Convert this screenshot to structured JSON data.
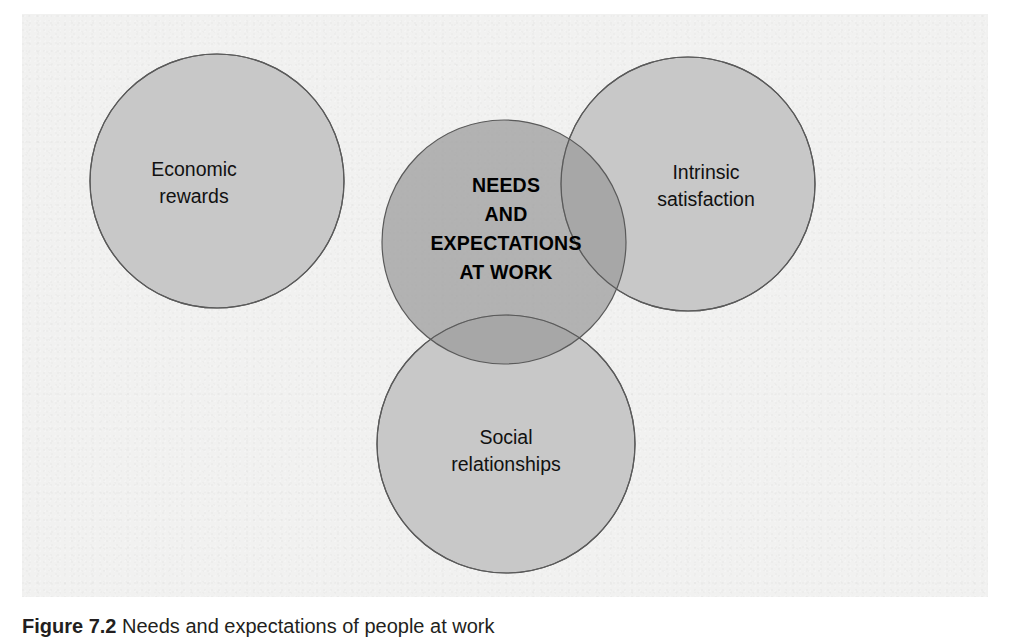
{
  "figure": {
    "caption_number": "Figure 7.2",
    "caption_text": "Needs and expectations of people at work",
    "panel_background": "#f1f1f0"
  },
  "diagram": {
    "type": "venn",
    "outer_circle_fill": "#c8c8c8",
    "center_circle_fill": "#a6a6a6",
    "stroke_color": "#5a5a5a",
    "center": {
      "name": "needs-and-expectations",
      "lines": [
        "NEEDS",
        "AND",
        "EXPECTATIONS",
        "AT WORK"
      ],
      "bold": true
    },
    "circles": [
      {
        "name": "economic-rewards",
        "position": "left",
        "lines": [
          "Economic",
          "rewards"
        ]
      },
      {
        "name": "intrinsic-satisfaction",
        "position": "right",
        "lines": [
          "Intrinsic",
          "satisfaction"
        ]
      },
      {
        "name": "social-relationships",
        "position": "bottom",
        "lines": [
          "Social",
          "relationships"
        ]
      }
    ]
  }
}
